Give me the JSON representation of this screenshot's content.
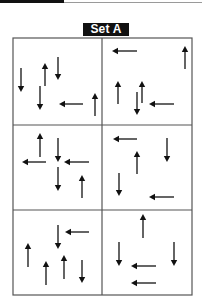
{
  "header": {
    "set_label": "Set A"
  },
  "grid": {
    "rows": 3,
    "cols": 2,
    "bounds": {
      "left": 13,
      "top": 38,
      "right": 192,
      "bottom": 295
    },
    "col_divider_x": 102,
    "row_divider_y": [
      125,
      210
    ],
    "line_color": "#555555",
    "arrow_color": "#111111"
  },
  "cells": [
    {
      "name": "cell-1",
      "arrows": [
        {
          "dir": "down",
          "x": 21,
          "y1": 68,
          "y2": 92
        },
        {
          "dir": "up",
          "x": 45,
          "y1": 63,
          "y2": 86
        },
        {
          "dir": "down",
          "x": 58,
          "y1": 57,
          "y2": 80
        },
        {
          "dir": "down",
          "x": 40,
          "y1": 86,
          "y2": 110
        },
        {
          "dir": "left",
          "y": 104,
          "x1": 59,
          "x2": 83
        },
        {
          "dir": "up",
          "x": 95,
          "y1": 93,
          "y2": 116
        }
      ]
    },
    {
      "name": "cell-2",
      "arrows": [
        {
          "dir": "left",
          "y": 51,
          "x1": 112,
          "x2": 137
        },
        {
          "dir": "up",
          "x": 185,
          "y1": 46,
          "y2": 69
        },
        {
          "dir": "up",
          "x": 118,
          "y1": 81,
          "y2": 104
        },
        {
          "dir": "up",
          "x": 142,
          "y1": 81,
          "y2": 103
        },
        {
          "dir": "down",
          "x": 137,
          "y1": 92,
          "y2": 115
        },
        {
          "dir": "left",
          "y": 104,
          "x1": 149,
          "x2": 174
        }
      ]
    },
    {
      "name": "cell-3",
      "arrows": [
        {
          "dir": "up",
          "x": 40,
          "y1": 133,
          "y2": 157
        },
        {
          "dir": "left",
          "y": 162,
          "x1": 22,
          "x2": 46
        },
        {
          "dir": "down",
          "x": 58,
          "y1": 138,
          "y2": 162
        },
        {
          "dir": "left",
          "y": 162,
          "x1": 64,
          "x2": 89
        },
        {
          "dir": "down",
          "x": 58,
          "y1": 167,
          "y2": 191
        },
        {
          "dir": "up",
          "x": 82,
          "y1": 175,
          "y2": 198
        }
      ]
    },
    {
      "name": "cell-4",
      "arrows": [
        {
          "dir": "left",
          "y": 139,
          "x1": 113,
          "x2": 137
        },
        {
          "dir": "down",
          "x": 167,
          "y1": 138,
          "y2": 162
        },
        {
          "dir": "up",
          "x": 137,
          "y1": 151,
          "y2": 174
        },
        {
          "dir": "down",
          "x": 119,
          "y1": 173,
          "y2": 196
        },
        {
          "dir": "left",
          "y": 197,
          "x1": 149,
          "x2": 174
        }
      ]
    },
    {
      "name": "cell-5",
      "arrows": [
        {
          "dir": "left",
          "y": 232,
          "x1": 65,
          "x2": 89
        },
        {
          "dir": "down",
          "x": 58,
          "y1": 225,
          "y2": 249
        },
        {
          "dir": "up",
          "x": 28,
          "y1": 243,
          "y2": 267
        },
        {
          "dir": "up",
          "x": 46,
          "y1": 261,
          "y2": 285
        },
        {
          "dir": "up",
          "x": 64,
          "y1": 255,
          "y2": 279
        },
        {
          "dir": "down",
          "x": 82,
          "y1": 260,
          "y2": 283
        }
      ]
    },
    {
      "name": "cell-6",
      "arrows": [
        {
          "dir": "up",
          "x": 143,
          "y1": 214,
          "y2": 238
        },
        {
          "dir": "down",
          "x": 119,
          "y1": 242,
          "y2": 266
        },
        {
          "dir": "down",
          "x": 174,
          "y1": 242,
          "y2": 266
        },
        {
          "dir": "left",
          "y": 266,
          "x1": 131,
          "x2": 156
        },
        {
          "dir": "left",
          "y": 283,
          "x1": 131,
          "x2": 156
        }
      ]
    }
  ]
}
